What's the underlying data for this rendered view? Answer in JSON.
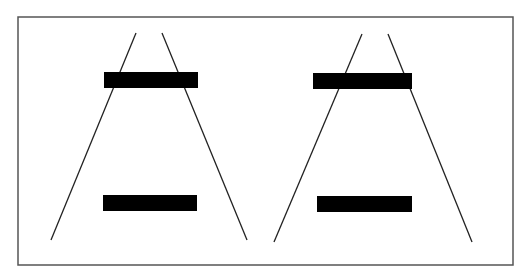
{
  "diagram": {
    "frame": {
      "x": 18,
      "y": 17,
      "width": 495,
      "height": 248,
      "stroke": "#555555"
    },
    "colors": {
      "background": "#ffffff",
      "line": "#222222",
      "bar": "#000000"
    },
    "panels": [
      {
        "name": "left-panel",
        "rails": [
          {
            "x1": 136,
            "y1": 33,
            "x2": 51,
            "y2": 240
          },
          {
            "x1": 162,
            "y1": 33,
            "x2": 247,
            "y2": 240
          }
        ],
        "bars": [
          {
            "name": "top-bar",
            "x": 104,
            "y": 72,
            "width": 94,
            "height": 16
          },
          {
            "name": "bottom-bar",
            "x": 103,
            "y": 195,
            "width": 94,
            "height": 16
          }
        ]
      },
      {
        "name": "right-panel",
        "rails": [
          {
            "x1": 362,
            "y1": 34,
            "x2": 274,
            "y2": 242
          },
          {
            "x1": 388,
            "y1": 34,
            "x2": 472,
            "y2": 242
          }
        ],
        "bars": [
          {
            "name": "top-bar",
            "x": 313,
            "y": 73,
            "width": 99,
            "height": 16
          },
          {
            "name": "bottom-bar",
            "x": 317,
            "y": 196,
            "width": 95,
            "height": 16
          }
        ]
      }
    ]
  }
}
